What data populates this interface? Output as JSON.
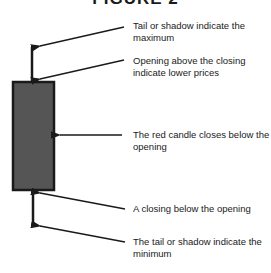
{
  "title": "FIGURE 2",
  "candle": {
    "type": "bearish",
    "body_color": "#555555",
    "border_color": "#1a1a1a"
  },
  "annotations": [
    {
      "id": "maximum",
      "text": "Tail or shadow indicate the maximum"
    },
    {
      "id": "opening",
      "text": "Opening above the closing indicate lower prices"
    },
    {
      "id": "body",
      "text": "The red candle closes below the opening"
    },
    {
      "id": "closing",
      "text": "A closing below the opening"
    },
    {
      "id": "minimum",
      "text": "The tail or shadow indicate the minimum"
    }
  ]
}
